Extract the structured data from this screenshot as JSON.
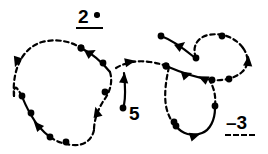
{
  "figure": {
    "background_color": "#ffffff",
    "stroke_color": "#000000",
    "width": 268,
    "height": 154
  },
  "labels": {
    "upper": {
      "text": "2",
      "marker": "filled-dot",
      "rule_style": "solid",
      "description": "2 with bullet and solid underline"
    },
    "middle": {
      "text": "5",
      "description": "label at end of short solid curve"
    },
    "lower_right": {
      "text": "–3",
      "rule_style": "dashed",
      "description": "minus 3 with dashed underline"
    }
  },
  "legend": {
    "solid_label": "2",
    "dashed_label": "–3"
  },
  "chart_data": {
    "type": "line",
    "title": "",
    "xlabel": "",
    "ylabel": "",
    "grid": false,
    "legend_position": "inline",
    "series": [
      {
        "name": "left-loop-dashed-upper",
        "style": "dashed",
        "path": "M 14 96 C 12 70, 22 48, 42 42 C 58 38, 72 42, 81 48",
        "markers": [
          {
            "type": "dot",
            "x": 81,
            "y": 48
          },
          {
            "type": "arrow",
            "x": 17,
            "y": 61,
            "angle": 108
          }
        ]
      },
      {
        "name": "left-loop-solid-upper-right",
        "style": "solid",
        "path": "M 81 48 C 93 54, 102 62, 110 72",
        "markers": [
          {
            "type": "dot",
            "x": 81,
            "y": 48
          },
          {
            "type": "arrow",
            "x": 90,
            "y": 53,
            "angle": -28
          },
          {
            "type": "dot",
            "x": 103,
            "y": 63
          }
        ]
      },
      {
        "name": "left-loop-dashed-descend",
        "style": "dashed",
        "path": "M 110 72 C 113 82, 110 92, 104 100 C 98 109, 94 120, 94 130",
        "markers": [
          {
            "type": "dot",
            "x": 105,
            "y": 92
          },
          {
            "type": "arrow",
            "x": 97,
            "y": 113,
            "angle": 255
          }
        ]
      },
      {
        "name": "left-loop-dashed-bottom",
        "style": "dashed",
        "path": "M 94 130 C 92 140, 84 146, 73 145 C 62 144, 56 141, 50 137",
        "markers": [
          {
            "type": "dot",
            "x": 66,
            "y": 142
          }
        ]
      },
      {
        "name": "left-loop-solid-lower-left",
        "style": "solid",
        "path": "M 50 137 C 42 131, 36 124, 31 115 C 27 108, 24 102, 22 96",
        "markers": [
          {
            "type": "dot",
            "x": 50,
            "y": 137
          },
          {
            "type": "arrow",
            "x": 38,
            "y": 126,
            "angle": 228
          },
          {
            "type": "dot",
            "x": 31,
            "y": 113
          },
          {
            "type": "dot",
            "x": 22,
            "y": 96
          }
        ]
      },
      {
        "name": "left-loop-dashed-close",
        "style": "dashed",
        "path": "M 22 96 C 17 88, 14 82, 14 96",
        "markers": []
      },
      {
        "name": "middle-solid-stub",
        "style": "solid",
        "path": "M 124 73 C 125 83, 126 95, 124 105",
        "markers": [
          {
            "type": "arrow",
            "x": 124,
            "y": 79,
            "angle": 275
          },
          {
            "type": "dot",
            "x": 123,
            "y": 108
          }
        ]
      },
      {
        "name": "middle-dashed-bridge",
        "style": "dashed",
        "path": "M 116 68 C 126 62, 138 60, 150 62 C 158 63, 164 65, 169 67",
        "markers": [
          {
            "type": "arrow",
            "x": 129,
            "y": 62,
            "angle": -12
          },
          {
            "type": "dot",
            "x": 166,
            "y": 66
          }
        ]
      },
      {
        "name": "right-solid-from-top-left",
        "style": "solid",
        "path": "M 161 36 C 172 40, 183 48, 194 57",
        "markers": [
          {
            "type": "dot",
            "x": 161,
            "y": 36
          },
          {
            "type": "arrow",
            "x": 180,
            "y": 46,
            "angle": -38
          },
          {
            "type": "dot",
            "x": 196,
            "y": 58
          }
        ]
      },
      {
        "name": "right-dashed-loop-top",
        "style": "dashed",
        "path": "M 196 58 C 192 48, 196 38, 208 35 C 222 32, 236 38, 243 48",
        "markers": [
          {
            "type": "dot",
            "x": 222,
            "y": 36
          }
        ]
      },
      {
        "name": "right-dashed-loop-right",
        "style": "dashed",
        "path": "M 243 48 C 249 56, 249 66, 242 72 C 234 79, 222 81, 212 80",
        "markers": [
          {
            "type": "arrow",
            "x": 248,
            "y": 62,
            "angle": 275
          },
          {
            "type": "dot",
            "x": 229,
            "y": 79
          }
        ]
      },
      {
        "name": "right-solid-cross",
        "style": "solid",
        "path": "M 166 66 C 180 72, 196 78, 212 80",
        "markers": [
          {
            "type": "dot",
            "x": 166,
            "y": 66
          },
          {
            "type": "arrow",
            "x": 186,
            "y": 75,
            "angle": -18
          },
          {
            "type": "arrow",
            "x": 204,
            "y": 79,
            "angle": 205
          },
          {
            "type": "dot",
            "x": 212,
            "y": 80
          }
        ]
      },
      {
        "name": "right-dashed-down",
        "style": "dashed",
        "path": "M 169 67 C 166 80, 164 94, 166 106 C 168 116, 172 122, 176 126",
        "markers": [
          {
            "type": "dot",
            "x": 174,
            "y": 122
          }
        ]
      },
      {
        "name": "right-solid-u-bottom",
        "style": "solid",
        "path": "M 176 126 C 182 134, 192 137, 202 133 C 210 130, 215 120, 215 108",
        "markers": [
          {
            "type": "dot",
            "x": 176,
            "y": 126
          },
          {
            "type": "arrow",
            "x": 194,
            "y": 136,
            "angle": -18
          },
          {
            "type": "dot",
            "x": 215,
            "y": 106
          }
        ]
      },
      {
        "name": "right-dashed-up-from-u",
        "style": "dashed",
        "path": "M 215 106 C 216 96, 214 88, 210 81",
        "markers": []
      }
    ]
  }
}
